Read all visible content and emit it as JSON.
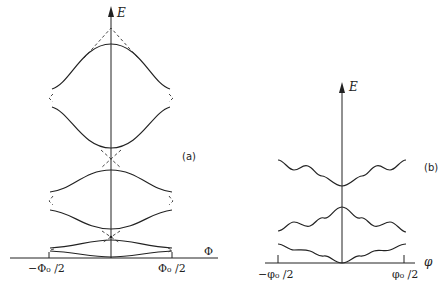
{
  "panels": [
    {
      "id": "a",
      "tag": "(a)",
      "y_axis_label": "E",
      "x_axis_label": "Φ",
      "x_tick_left": "−Φ₀ /2",
      "x_tick_right": "Φ₀ /2",
      "description": "Energy bands vs flux with avoided crossings (dashed lines show unperturbed parabolas)",
      "bands": [
        {
          "name": "band-1",
          "upper_shape": "maximum at Φ=0",
          "lower_shape": "minimum at Φ=0"
        },
        {
          "name": "band-2",
          "upper_shape": "maximum at Φ=0",
          "lower_shape": "minimum at Φ=0"
        },
        {
          "name": "band-3",
          "upper_shape": "maximum at Φ=0",
          "lower_shape": "minimum at Φ=0"
        }
      ]
    },
    {
      "id": "b",
      "tag": "(b)",
      "y_axis_label": "E",
      "x_axis_label": "φ",
      "x_tick_left": "−φ₀ /2",
      "x_tick_right": "φ₀ /2",
      "description": "Oscillating energy levels vs flux",
      "bands": [
        {
          "name": "level-top",
          "shape": "oscillating, minimum at φ=0"
        },
        {
          "name": "level-middle",
          "shape": "oscillating, maximum at φ=0"
        },
        {
          "name": "level-bottom",
          "shape": "oscillating, minimum at φ=0 (touching axis)"
        }
      ]
    }
  ]
}
